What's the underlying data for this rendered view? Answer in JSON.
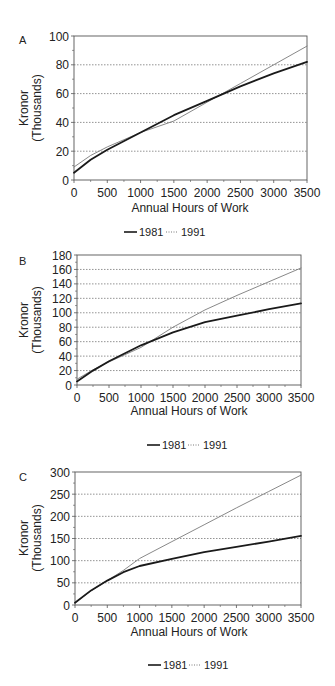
{
  "chart_data": [
    {
      "panel_label": "A",
      "type": "line",
      "title": "",
      "xlabel": "Annual Hours of Work",
      "ylabel": "Kronor (Thousands)",
      "ylabel_lines": [
        "Kronor",
        "(Thousands)"
      ],
      "xlim": [
        0,
        3500
      ],
      "ylim": [
        0,
        100
      ],
      "xticks": [
        0,
        500,
        1000,
        1500,
        2000,
        2500,
        3000,
        3500
      ],
      "yticks": [
        0,
        20,
        40,
        60,
        80,
        100
      ],
      "grid": "horizontal dotted",
      "legend_position": "bottom",
      "x": [
        0,
        250,
        500,
        1000,
        1500,
        2000,
        2500,
        3000,
        3500
      ],
      "series": [
        {
          "name": "1981",
          "style": "solid-thick",
          "values": [
            5,
            14,
            21,
            33,
            45,
            55,
            65,
            74,
            82
          ]
        },
        {
          "name": "1991",
          "style": "thin",
          "values": [
            9,
            17,
            23,
            33,
            41,
            54,
            67,
            80,
            93
          ]
        }
      ]
    },
    {
      "panel_label": "B",
      "type": "line",
      "title": "",
      "xlabel": "Annual Hours of Work",
      "ylabel": "Kronor (Thousands)",
      "ylabel_lines": [
        "Kronor",
        "(Thousands)"
      ],
      "xlim": [
        0,
        3500
      ],
      "ylim": [
        0,
        180
      ],
      "xticks": [
        0,
        500,
        1000,
        1500,
        2000,
        2500,
        3000,
        3500
      ],
      "yticks": [
        0,
        20,
        40,
        60,
        80,
        100,
        120,
        140,
        160,
        180
      ],
      "grid": "horizontal dotted",
      "legend_position": "bottom",
      "x": [
        0,
        250,
        500,
        1000,
        1500,
        2000,
        2500,
        3000,
        3500
      ],
      "series": [
        {
          "name": "1981",
          "style": "solid-thick",
          "values": [
            5,
            20,
            33,
            55,
            73,
            87,
            96,
            105,
            113
          ]
        },
        {
          "name": "1991",
          "style": "thin",
          "values": [
            8,
            21,
            32,
            52,
            80,
            104,
            124,
            143,
            162
          ]
        }
      ]
    },
    {
      "panel_label": "C",
      "type": "line",
      "title": "",
      "xlabel": "Annual Hours of Work",
      "ylabel": "Kronor (Thousands)",
      "ylabel_lines": [
        "Kronor",
        "(Thousands)"
      ],
      "xlim": [
        0,
        3500
      ],
      "ylim": [
        0,
        300
      ],
      "xticks": [
        0,
        500,
        1000,
        1500,
        2000,
        2500,
        3000,
        3500
      ],
      "yticks": [
        0,
        50,
        100,
        150,
        200,
        250,
        300
      ],
      "grid": "horizontal dotted",
      "legend_position": "bottom",
      "x": [
        0,
        250,
        500,
        750,
        1000,
        1500,
        2000,
        2500,
        3000,
        3500
      ],
      "series": [
        {
          "name": "1981",
          "style": "solid-thick",
          "values": [
            5,
            33,
            55,
            74,
            88,
            104,
            119,
            131,
            143,
            156
          ]
        },
        {
          "name": "1991",
          "style": "thin",
          "values": [
            5,
            32,
            55,
            78,
            105,
            143,
            181,
            219,
            256,
            293
          ]
        }
      ]
    }
  ],
  "panels": [
    {
      "label": "A",
      "ylabel_line1": "Kronor",
      "ylabel_line2": "(Thousands)",
      "xlabel": "Annual Hours of Work",
      "legend": {
        "item1": "1981",
        "item2": "1991"
      }
    },
    {
      "label": "B",
      "ylabel_line1": "Kronor",
      "ylabel_line2": "(Thousands)",
      "xlabel": "Annual Hours of Work",
      "legend": {
        "item1": "1981",
        "item2": "1991"
      }
    },
    {
      "label": "C",
      "ylabel_line1": "Kronor",
      "ylabel_line2": "(Thousands)",
      "xlabel": "Annual Hours of Work",
      "legend": {
        "item1": "1981",
        "item2": "1991"
      }
    }
  ],
  "colors": {
    "line_1981": "#1a1a1a",
    "line_1991": "#7a7a7a",
    "frame": "#555555",
    "grid": "#666666"
  }
}
